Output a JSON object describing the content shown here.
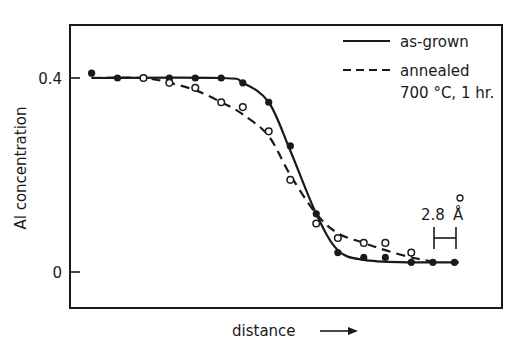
{
  "chart_data": {
    "type": "scatter",
    "title": "",
    "xlabel": "distance",
    "xlabel_arrow": "→",
    "ylabel": "Al concentration",
    "yticks": [
      {
        "value": 0,
        "label": "0"
      },
      {
        "value": 0.4,
        "label": "0.4"
      }
    ],
    "ylim": [
      -0.075,
      0.505
    ],
    "xlim": [
      0,
      100
    ],
    "grid": false,
    "legend_position": "upper right",
    "scale_bar": {
      "label": "2.8 Å",
      "length_units": "2.8 Å"
    },
    "series": [
      {
        "name": "as-grown",
        "line_style": "solid",
        "marker": "filled-circle",
        "x": [
          5,
          11,
          17,
          23,
          29,
          35,
          40,
          46,
          51,
          57,
          62,
          68,
          73,
          79,
          84,
          89
        ],
        "y": [
          0.41,
          0.4,
          0.4,
          0.4,
          0.4,
          0.4,
          0.39,
          0.35,
          0.26,
          0.12,
          0.04,
          0.03,
          0.03,
          0.02,
          0.02,
          0.02
        ]
      },
      {
        "name": "annealed 700 °C, 1 hr.",
        "line_style": "dashed",
        "marker": "open-circle",
        "x": [
          17,
          23,
          29,
          35,
          40,
          46,
          51,
          57,
          62,
          68,
          73,
          79
        ],
        "y": [
          0.4,
          0.39,
          0.38,
          0.35,
          0.34,
          0.29,
          0.19,
          0.1,
          0.07,
          0.06,
          0.06,
          0.04
        ]
      }
    ]
  },
  "legend": {
    "items": [
      {
        "label": "as-grown"
      },
      {
        "label_line1": "annealed",
        "label_line2": "700 °C, 1 hr."
      }
    ]
  },
  "axes": {
    "ylabel": "Al concentration",
    "xlabel": "distance",
    "ytick_top": "0.4",
    "ytick_bottom": "0"
  },
  "scale_bar": {
    "value": "2.8",
    "unit": "Å"
  }
}
